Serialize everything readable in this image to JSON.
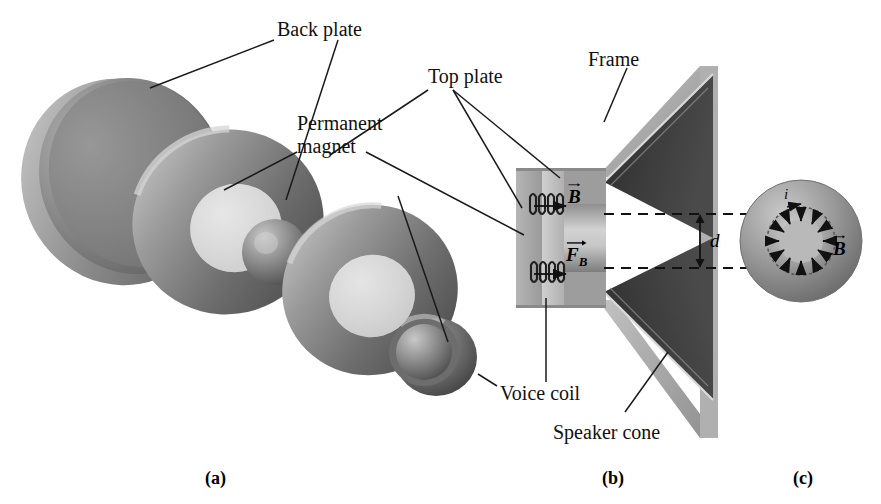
{
  "figure": {
    "caption_labels": [
      {
        "id": "a",
        "text": "(a)",
        "x": 205,
        "y": 468
      },
      {
        "id": "b",
        "text": "(b)",
        "x": 602,
        "y": 468
      },
      {
        "id": "c",
        "text": "(c)",
        "x": 793,
        "y": 468
      }
    ],
    "callouts": [
      {
        "name": "back-plate",
        "text": "Back plate",
        "x": 277,
        "y": 18
      },
      {
        "name": "permanent-magnet",
        "text": "Permanent",
        "x": 297,
        "y": 115
      },
      {
        "name": "permanent-magnet2",
        "text": "magnet",
        "x": 297,
        "y": 138
      },
      {
        "name": "top-plate",
        "text": "Top plate",
        "x": 428,
        "y": 68
      },
      {
        "name": "frame",
        "text": "Frame",
        "x": 588,
        "y": 50
      },
      {
        "name": "voice-coil",
        "text": "Voice coil",
        "x": 500,
        "y": 385
      },
      {
        "name": "speaker-cone",
        "text": "Speaker cone",
        "x": 553,
        "y": 424
      }
    ],
    "vectors": [
      {
        "name": "b-field-gap",
        "symbol": "B",
        "sub": "",
        "x": 568,
        "y": 192
      },
      {
        "name": "magnetic-force",
        "symbol": "F",
        "sub": "B",
        "x": 566,
        "y": 250
      },
      {
        "name": "b-field-radial",
        "symbol": "B",
        "sub": "",
        "x": 833,
        "y": 245
      }
    ],
    "dimension": {
      "name": "gap-spacing",
      "symbol": "d",
      "x": 710,
      "y": 238
    },
    "current": {
      "name": "current-label",
      "symbol": "i",
      "x": 784,
      "y": 192
    },
    "colors": {
      "background": "#ffffff",
      "metal_light": "#b9b9b9",
      "metal_mid": "#8e8e8e",
      "metal_dark": "#6a6a6a",
      "metal_darker": "#4e4e4e",
      "cone_dark": "#3a3a3a",
      "cone_darkest": "#222222",
      "frame_light": "#a9a9a9",
      "line": "#1a1a1a",
      "dash": "#111111"
    }
  }
}
